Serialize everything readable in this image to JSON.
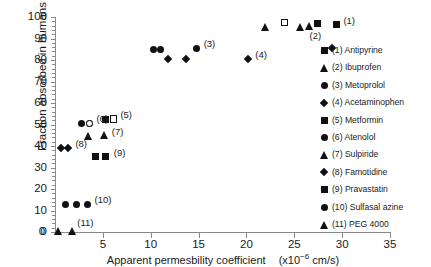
{
  "chart_data": {
    "type": "scatter",
    "title": "",
    "xlabel": "Apparent permesbility coefficient  (x10−6 cm/s)",
    "xlabel_main": "Apparent permesbility coefficient",
    "xlabel_units_pre": "(x10",
    "xlabel_units_exp": "−6",
    "xlabel_units_post": " cm/s)",
    "ylabel": "Fraction absorbed in humans  (%)",
    "xlim": [
      0,
      35
    ],
    "ylim": [
      0,
      100
    ],
    "xticks": [
      0,
      5,
      10,
      15,
      20,
      25,
      30,
      35
    ],
    "yticks": [
      0,
      10,
      20,
      30,
      40,
      50,
      60,
      70,
      80,
      90,
      100
    ],
    "ytick_labels": [
      "0",
      "10",
      "20",
      "30",
      "40",
      "50",
      "60",
      "70",
      "80",
      "90",
      "100"
    ],
    "xtick_labels": [
      "0",
      "5",
      "10",
      "15",
      "20",
      "25",
      "30",
      "35"
    ],
    "grid": false,
    "legend_position": "right",
    "marker_color": "#111111",
    "axis_color": "#8a8a8a",
    "series": [
      {
        "id": 1,
        "name": "Antipyrine",
        "label": "(1)",
        "marker": "square",
        "points": [
          {
            "x": 27.4,
            "y": 97.0
          },
          {
            "x": 29.4,
            "y": 96.5
          }
        ],
        "annotation": {
          "text": "(1)",
          "x": 29.4,
          "y": 96.5,
          "dx": 7,
          "dy": -4
        }
      },
      {
        "id": 2,
        "name": "Ibuprofen",
        "label": "(2)",
        "marker": "triangle",
        "points": [
          {
            "x": 22.0,
            "y": 95.5
          },
          {
            "x": 25.6,
            "y": 95.5
          },
          {
            "x": 26.6,
            "y": 96.0
          }
        ],
        "annotation": {
          "text": "(2)",
          "x": 26.6,
          "y": 96.0,
          "dx": 0,
          "dy": 10
        }
      },
      {
        "id": 3,
        "name": "Metoprolol",
        "label": "(3)",
        "marker": "circle",
        "points": [
          {
            "x": 10.3,
            "y": 85.0
          },
          {
            "x": 11.0,
            "y": 85.0
          },
          {
            "x": 14.8,
            "y": 85.5
          }
        ],
        "annotation": {
          "text": "(3)",
          "x": 14.8,
          "y": 85.5,
          "dx": 7,
          "dy": -4
        }
      },
      {
        "id": 4,
        "name": "Acetaminophen",
        "label": "(4)",
        "marker": "diamond",
        "points": [
          {
            "x": 11.8,
            "y": 80.5
          },
          {
            "x": 13.7,
            "y": 80.5
          },
          {
            "x": 20.2,
            "y": 80.5
          },
          {
            "x": 28.9,
            "y": 85.5
          }
        ],
        "annotation": {
          "text": "(4)",
          "x": 20.2,
          "y": 80.5,
          "dx": 7,
          "dy": -4
        }
      },
      {
        "id": 5,
        "name": "Metformin",
        "label": "(5)",
        "marker": "square",
        "points": [
          {
            "x": 5.3,
            "y": 52.5
          },
          {
            "x": 6.1,
            "y": 52.5
          }
        ],
        "annotation": {
          "text": "(5)",
          "x": 6.1,
          "y": 52.5,
          "dx": 7,
          "dy": -4
        }
      },
      {
        "id": 6,
        "name": "Atenolol",
        "label": "(6)",
        "marker": "circle",
        "points": [
          {
            "x": 2.8,
            "y": 50.5
          },
          {
            "x": 3.6,
            "y": 50.5
          }
        ],
        "annotation": {
          "text": "(6)",
          "x": 3.6,
          "y": 50.5,
          "dx": 7,
          "dy": -4
        }
      },
      {
        "id": 7,
        "name": "Sulpiride",
        "label": "(7)",
        "marker": "triangle",
        "points": [
          {
            "x": 3.5,
            "y": 44.5
          },
          {
            "x": 5.2,
            "y": 45.0
          }
        ],
        "annotation": {
          "text": "(7)",
          "x": 5.2,
          "y": 45.0,
          "dx": 7,
          "dy": -3
        }
      },
      {
        "id": 8,
        "name": "Famotidine",
        "label": "(8)",
        "marker": "diamond",
        "points": [
          {
            "x": 0.6,
            "y": 39.0
          },
          {
            "x": 1.4,
            "y": 39.0
          }
        ],
        "annotation": {
          "text": "(8)",
          "x": 1.4,
          "y": 39.0,
          "dx": 7,
          "dy": -4
        }
      },
      {
        "id": 9,
        "name": "Pravastatin",
        "label": "(9)",
        "marker": "square",
        "points": [
          {
            "x": 4.2,
            "y": 35.0
          },
          {
            "x": 5.3,
            "y": 35.0
          }
        ],
        "annotation": {
          "text": "(9)",
          "x": 5.3,
          "y": 35.0,
          "dx": 8,
          "dy": -4
        }
      },
      {
        "id": 10,
        "name": "Sulfasal azine",
        "label": "(10)",
        "marker": "circle",
        "points": [
          {
            "x": 1.1,
            "y": 13.0
          },
          {
            "x": 2.2,
            "y": 13.0
          },
          {
            "x": 3.4,
            "y": 13.0
          }
        ],
        "annotation": {
          "text": "(10)",
          "x": 3.4,
          "y": 13.0,
          "dx": 7,
          "dy": -4
        }
      },
      {
        "id": 11,
        "name": "PEG 4000",
        "label": "(11)",
        "marker": "triangle",
        "points": [
          {
            "x": 0.4,
            "y": 0.5
          },
          {
            "x": 1.8,
            "y": 0.5
          }
        ],
        "annotation": {
          "text": "(11)",
          "x": 1.8,
          "y": 0.5,
          "dx": 5,
          "dy": -8
        }
      }
    ],
    "extra_markers": [
      {
        "marker": "square-open",
        "x": 24.0,
        "y": 97.5,
        "note": "open square"
      },
      {
        "marker": "circle-open",
        "x": 3.6,
        "y": 50.5,
        "note": "open circle overlapping (6)"
      },
      {
        "marker": "square-open",
        "x": 6.1,
        "y": 52.5,
        "note": "partly open square in (5) pair"
      }
    ]
  },
  "legend": {
    "entries": [
      {
        "label": "(1)",
        "name": "Antipyrine",
        "marker": "square"
      },
      {
        "label": "(2)",
        "name": "Ibuprofen",
        "marker": "triangle"
      },
      {
        "label": "(3)",
        "name": "Metoprolol",
        "marker": "circle"
      },
      {
        "label": "(4)",
        "name": "Acetaminophen",
        "marker": "diamond"
      },
      {
        "label": "(5)",
        "name": "Metformin",
        "marker": "square"
      },
      {
        "label": "(6)",
        "name": "Atenolol",
        "marker": "circle"
      },
      {
        "label": "(7)",
        "name": "Sulpiride",
        "marker": "triangle"
      },
      {
        "label": "(8)",
        "name": "Famotidine",
        "marker": "diamond"
      },
      {
        "label": "(9)",
        "name": "Pravastatin",
        "marker": "square"
      },
      {
        "label": "(10)",
        "name": "Sulfasal azine",
        "marker": "circle"
      },
      {
        "label": "(11)",
        "name": "PEG 4000",
        "marker": "triangle"
      }
    ]
  }
}
